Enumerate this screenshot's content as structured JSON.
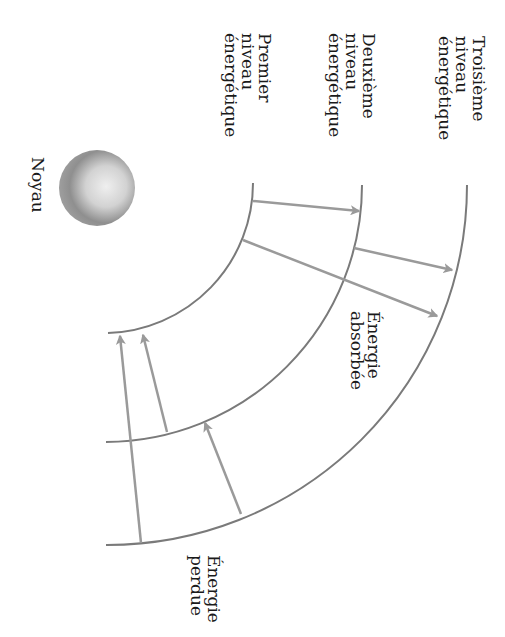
{
  "diagram": {
    "colors": {
      "arc": "#7a7a7a",
      "arrow": "#9a9a9a",
      "text": "#1a1a1a",
      "nucleus_light": "#e8e8e8",
      "nucleus_dark": "#7c7c7c"
    },
    "nucleus": {
      "label": "Noyau",
      "cx": 97,
      "cy": 188,
      "r": 38
    },
    "levels": [
      {
        "id": "premier",
        "label_lines": [
          "Premier",
          "niveau",
          "énergétique"
        ],
        "radius": 150
      },
      {
        "id": "deuxieme",
        "label_lines": [
          "Deuxième",
          "niveau",
          "énergétique"
        ],
        "radius": 257
      },
      {
        "id": "troisieme",
        "label_lines": [
          "Troisième",
          "niveau",
          "énergétique"
        ],
        "radius": 360
      }
    ],
    "annotations": {
      "absorbed": [
        "Énergie",
        "absorbée"
      ],
      "lost": [
        "Énergie",
        "perdue"
      ]
    },
    "arrows": [
      {
        "type": "absorbed",
        "from": "premier",
        "to": "deuxieme",
        "x1": 253,
        "y1": 201,
        "x2": 359,
        "y2": 211
      },
      {
        "type": "absorbed",
        "from": "deuxieme",
        "to": "troisieme",
        "x1": 354,
        "y1": 248,
        "x2": 452,
        "y2": 270
      },
      {
        "type": "absorbed",
        "from": "premier",
        "to": "troisieme",
        "x1": 243,
        "y1": 240,
        "x2": 437,
        "y2": 316
      },
      {
        "type": "lost",
        "from": "deuxieme",
        "to": "premier",
        "x1": 167,
        "y1": 432,
        "x2": 143,
        "y2": 335
      },
      {
        "type": "lost",
        "from": "troisieme",
        "to": "premier",
        "x1": 141,
        "y1": 543,
        "x2": 120,
        "y2": 336
      },
      {
        "type": "lost",
        "from": "troisieme",
        "to": "deuxieme",
        "x1": 241,
        "y1": 514,
        "x2": 205,
        "y2": 423
      }
    ]
  }
}
